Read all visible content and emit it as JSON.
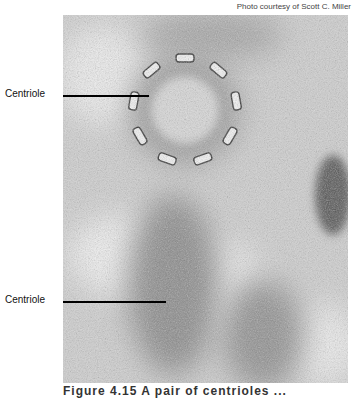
{
  "figure": {
    "credit": "Photo courtesy of Scott C. Miller",
    "labels": [
      {
        "text": "Centriole",
        "position": "upper"
      },
      {
        "text": "Centriole",
        "position": "lower"
      }
    ],
    "caption_partial": "Figure 4.15  A pair of centrioles  ..."
  }
}
